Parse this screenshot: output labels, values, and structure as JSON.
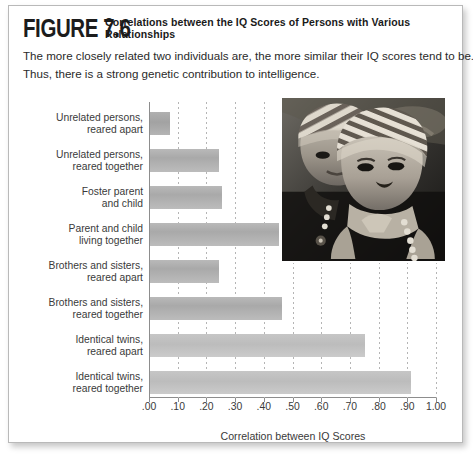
{
  "figure": {
    "label": "FIGURE 7.6",
    "title": "Correlations between the IQ Scores of Persons with Various Relationships",
    "caption_line1": "The more closely related two individuals are, the more similar their IQ scores tend to be.",
    "caption_line2": "Thus, there is a strong genetic contribution to intelligence."
  },
  "photo": {
    "alt": "black-and-white photograph of two young children wearing striped knit caps"
  },
  "chart_data": {
    "type": "bar",
    "orientation": "horizontal",
    "title": "Correlations between the IQ Scores of Persons with Various Relationships",
    "xlabel": "Correlation between IQ Scores",
    "ylabel": "",
    "xlim": [
      0,
      1.0
    ],
    "grid": true,
    "legend": "none",
    "tick_labels": [
      ".00",
      ".10",
      ".20",
      ".30",
      ".40",
      ".50",
      ".60",
      ".70",
      ".80",
      ".90",
      "1.00"
    ],
    "ticks": [
      0.0,
      0.1,
      0.2,
      0.3,
      0.4,
      0.5,
      0.6,
      0.7,
      0.8,
      0.9,
      1.0
    ],
    "categories": [
      "Unrelated persons,\nreared apart",
      "Unrelated persons,\nreared together",
      "Foster parent\nand child",
      "Parent and child\nliving together",
      "Brothers and sisters,\nreared apart",
      "Brothers and sisters,\nreared together",
      "Identical twins,\nreared apart",
      "Identical twins,\nreared together"
    ],
    "values": [
      0.07,
      0.24,
      0.25,
      0.45,
      0.24,
      0.46,
      0.75,
      0.91
    ]
  },
  "colors": {
    "bar_fill": "#aeaeae",
    "bar_fill_light": "#c2c2c2",
    "axis": "#8d8d8d",
    "gridline": "#b5b5b5",
    "card_border": "#b9b9b9",
    "text": "#3a3a3a"
  }
}
